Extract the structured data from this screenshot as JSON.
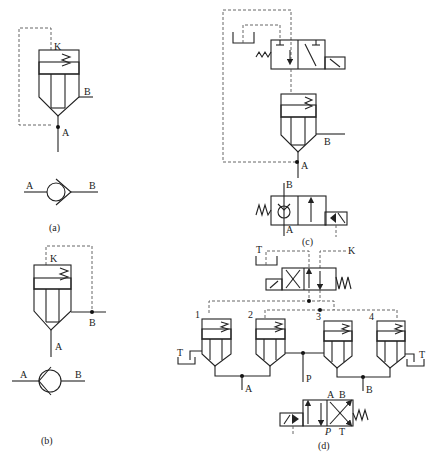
{
  "figure": {
    "panels": [
      {
        "id": "a",
        "caption": "(a)",
        "ports": {
          "control": "K",
          "main_in": "A",
          "main_out": "B"
        },
        "check_valve": {
          "left": "A",
          "right": "B"
        }
      },
      {
        "id": "b",
        "caption": "(b)",
        "ports": {
          "control": "K",
          "main_in": "A",
          "main_out": "B"
        },
        "check_valve": {
          "left": "A",
          "right": "B"
        }
      },
      {
        "id": "c",
        "caption": "(c)",
        "ports": {
          "main_in": "A",
          "main_out": "B"
        },
        "valve2": {
          "top": "B",
          "bottom": "A"
        }
      },
      {
        "id": "d",
        "caption": "(d)",
        "pilot_valve": {
          "tank": "T",
          "control": "K"
        },
        "cartridges": [
          "1",
          "2",
          "3",
          "4"
        ],
        "ports": {
          "tank_left": "T",
          "tank_right": "T",
          "a": "A",
          "p": "P",
          "b": "B"
        },
        "directional_valve": {
          "A": "A",
          "B": "B",
          "P": "P",
          "T": "T"
        }
      }
    ]
  }
}
